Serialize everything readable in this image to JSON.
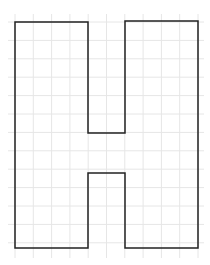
{
  "diagram": {
    "type": "grid-letter-outline",
    "letter": "H",
    "colors": {
      "background": "#ffffff",
      "grid": "#e6e6e6",
      "outline": "#222222"
    },
    "grid": {
      "x_lines": [
        15,
        33.3,
        51.6,
        69.9,
        88.2,
        106.5,
        124.8,
        143.1,
        161.4,
        179.7,
        198
      ],
      "y_lines": [
        22,
        40.4,
        58.8,
        77.2,
        95.6,
        114,
        132.4,
        150.8,
        169.2,
        187.6,
        206,
        224.4,
        242.8
      ],
      "x_extent": [
        8,
        204
      ],
      "y_extent": [
        14,
        258
      ]
    },
    "outline_points": "15,22 88,22 88,133 125,133 125,21 198,21 198,248 125,248 125,173 88,173 88,248 15,248"
  }
}
